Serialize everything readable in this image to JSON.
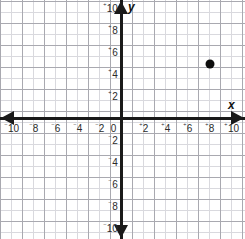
{
  "chart_data": {
    "type": "scatter",
    "title": "",
    "xlabel": "x",
    "ylabel": "y",
    "xlim": [
      -11,
      11
    ],
    "ylim": [
      -10.8,
      10.8
    ],
    "grid": true,
    "grid_minor_step": 1,
    "grid_major_step": 2,
    "legend": "none",
    "x_tick_labels": [
      "⁻10",
      "⁻8",
      "⁻6",
      "⁻4",
      "⁻2",
      "0",
      "⁺2",
      "⁺4",
      "⁺6",
      "⁺8",
      "⁺10"
    ],
    "y_tick_labels": [
      "⁺10",
      "⁺8",
      "⁺6",
      "⁺4",
      "⁺2",
      "⁻2",
      "⁻4",
      "⁻6",
      "⁻8",
      "⁻10"
    ],
    "points": [
      {
        "label": "plotted-point",
        "x": 8,
        "y": 5
      }
    ],
    "colors": {
      "point": "#0d0d0d",
      "axis": "#1a1a1a",
      "grid_minor": "#d9d9de",
      "grid_major": "#a9a9b0",
      "label": "#2b2b2b",
      "background": "#ffffff"
    }
  },
  "axes": {
    "x_name": "x",
    "y_name": "y",
    "origin_label": "0"
  },
  "x_ticks": [
    {
      "sign": "⁻",
      "num": "10",
      "value": -10
    },
    {
      "sign": "⁻",
      "num": "8",
      "value": -8
    },
    {
      "sign": "⁻",
      "num": "6",
      "value": -6
    },
    {
      "sign": "⁻",
      "num": "4",
      "value": -4
    },
    {
      "sign": "⁻",
      "num": "2",
      "value": -2
    },
    {
      "sign": "",
      "num": "0",
      "value": 0
    },
    {
      "sign": "⁺",
      "num": "2",
      "value": 2
    },
    {
      "sign": "⁺",
      "num": "4",
      "value": 4
    },
    {
      "sign": "⁺",
      "num": "6",
      "value": 6
    },
    {
      "sign": "⁺",
      "num": "8",
      "value": 8
    },
    {
      "sign": "⁺",
      "num": "10",
      "value": 10
    }
  ],
  "y_ticks": [
    {
      "sign": "⁺",
      "num": "10",
      "value": 10
    },
    {
      "sign": "⁺",
      "num": "8",
      "value": 8
    },
    {
      "sign": "⁺",
      "num": "6",
      "value": 6
    },
    {
      "sign": "⁺",
      "num": "4",
      "value": 4
    },
    {
      "sign": "⁺",
      "num": "2",
      "value": 2
    },
    {
      "sign": "⁻",
      "num": "2",
      "value": -2
    },
    {
      "sign": "⁻",
      "num": "4",
      "value": -4
    },
    {
      "sign": "⁻",
      "num": "6",
      "value": -6
    },
    {
      "sign": "⁻",
      "num": "8",
      "value": -8
    },
    {
      "sign": "⁻",
      "num": "10",
      "value": -10
    }
  ]
}
